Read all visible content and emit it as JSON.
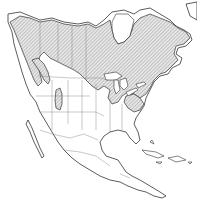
{
  "map": {
    "subject": "species range map",
    "region": "North America",
    "legend": [],
    "range_style": {
      "fill": "diagonal hatching",
      "hatch_color": "#9a9a9a",
      "outline_color": "#333333"
    },
    "land_color": "#ffffff",
    "border_color": "#777777",
    "range_extent": [
      "Alaska (interior, southern)",
      "Yukon and Northwest Territories (southern)",
      "British Columbia (interior)",
      "Alberta, Saskatchewan, Manitoba",
      "Ontario and Quebec",
      "Labrador, Newfoundland, Maritime provinces",
      "Northern Rocky Mountains (Montana, Idaho, Wyoming)",
      "Colorado isolated area",
      "Great Lakes states",
      "New England and northern Appalachians"
    ]
  }
}
